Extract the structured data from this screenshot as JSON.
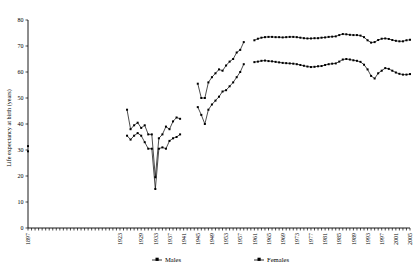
{
  "chart_data": {
    "type": "line",
    "title": "",
    "xlabel": "",
    "ylabel": "Life expectancy at birth (years)",
    "ylim": [
      0,
      80
    ],
    "ytick_step": 10,
    "yticks": [
      0,
      10,
      20,
      30,
      40,
      50,
      60,
      70,
      80
    ],
    "xlim": [
      1897,
      2005
    ],
    "xtick_labels": [
      "1897",
      "1923",
      "1929",
      "1933",
      "1937",
      "1941",
      "1945",
      "1949",
      "1953",
      "1957",
      "1961",
      "1965",
      "1969",
      "1973",
      "1977",
      "1981",
      "1985",
      "1989",
      "1993",
      "1997",
      "2001",
      "2005"
    ],
    "xtick_label_years": [
      1897,
      1923,
      1929,
      1933,
      1937,
      1941,
      1945,
      1949,
      1953,
      1957,
      1961,
      1965,
      1969,
      1973,
      1977,
      1981,
      1985,
      1989,
      1993,
      1997,
      2001,
      2005
    ],
    "grid": false,
    "legend_position": "bottom",
    "marker": "square",
    "series": [
      {
        "name": "Males",
        "marker": "square",
        "color": "#000000",
        "segments": [
          {
            "x": [
              1897
            ],
            "values": [
              29.5
            ]
          },
          {
            "x": [
              1925,
              1926,
              1927,
              1928,
              1929,
              1930,
              1931,
              1932,
              1933,
              1934,
              1935,
              1936,
              1937,
              1938,
              1939,
              1940
            ],
            "values": [
              35.5,
              34.0,
              35.5,
              36.5,
              35.5,
              33.0,
              30.5,
              30.5,
              15.0,
              30.5,
              31.0,
              30.5,
              33.5,
              34.5,
              35.0,
              36.0
            ]
          },
          {
            "x": [
              1945,
              1946,
              1947,
              1948,
              1949,
              1950,
              1951,
              1952,
              1953,
              1954,
              1955,
              1956,
              1957,
              1958
            ],
            "values": [
              46.5,
              43.5,
              40.0,
              45.5,
              47.5,
              49.0,
              50.5,
              52.5,
              53.0,
              54.5,
              56.0,
              58.0,
              60.0,
              63.0
            ]
          },
          {
            "x": [
              1961,
              1962,
              1963,
              1964,
              1965,
              1966,
              1967,
              1968,
              1969,
              1970,
              1971,
              1972,
              1973,
              1974,
              1975,
              1976,
              1977,
              1978,
              1979,
              1980,
              1981,
              1982,
              1983,
              1984,
              1985,
              1986,
              1987,
              1988,
              1989,
              1990,
              1991,
              1992,
              1993,
              1994,
              1995,
              1996,
              1997,
              1998,
              1999,
              2000,
              2001,
              2002,
              2003,
              2004,
              2005
            ],
            "values": [
              63.8,
              64.0,
              64.3,
              64.4,
              64.2,
              64.1,
              63.9,
              63.7,
              63.5,
              63.4,
              63.3,
              63.2,
              63.0,
              62.7,
              62.4,
              62.1,
              61.9,
              62.0,
              62.2,
              62.3,
              62.7,
              63.0,
              63.2,
              63.3,
              64.0,
              64.8,
              65.0,
              64.8,
              64.5,
              64.3,
              63.9,
              62.8,
              61.0,
              58.5,
              57.5,
              59.5,
              60.5,
              61.5,
              61.2,
              60.5,
              59.8,
              59.3,
              59.0,
              59.0,
              59.2
            ]
          }
        ]
      },
      {
        "name": "Females",
        "marker": "square",
        "color": "#000000",
        "segments": [
          {
            "x": [
              1897
            ],
            "values": [
              31.5
            ]
          },
          {
            "x": [
              1925,
              1926,
              1927,
              1928,
              1929,
              1930,
              1931,
              1932,
              1933,
              1934,
              1935,
              1936,
              1937,
              1938,
              1939,
              1940
            ],
            "values": [
              45.5,
              38.0,
              39.5,
              40.5,
              38.5,
              39.5,
              36.0,
              36.0,
              19.5,
              34.5,
              36.0,
              39.0,
              38.0,
              41.0,
              42.5,
              42.0
            ]
          },
          {
            "x": [
              1945,
              1946,
              1947,
              1948,
              1949,
              1950,
              1951,
              1952,
              1953,
              1954,
              1955,
              1956,
              1957,
              1958
            ],
            "values": [
              55.5,
              50.0,
              50.0,
              56.0,
              58.0,
              59.5,
              61.0,
              60.5,
              62.5,
              64.0,
              65.0,
              67.5,
              68.5,
              71.5
            ]
          },
          {
            "x": [
              1961,
              1962,
              1963,
              1964,
              1965,
              1966,
              1967,
              1968,
              1969,
              1970,
              1971,
              1972,
              1973,
              1974,
              1975,
              1976,
              1977,
              1978,
              1979,
              1980,
              1981,
              1982,
              1983,
              1984,
              1985,
              1986,
              1987,
              1988,
              1989,
              1990,
              1991,
              1992,
              1993,
              1994,
              1995,
              1996,
              1997,
              1998,
              1999,
              2000,
              2001,
              2002,
              2003,
              2004,
              2005
            ],
            "values": [
              72.2,
              72.8,
              73.2,
              73.4,
              73.5,
              73.5,
              73.4,
              73.4,
              73.3,
              73.4,
              73.5,
              73.5,
              73.4,
              73.2,
              73.0,
              72.9,
              72.9,
              73.0,
              73.0,
              73.2,
              73.3,
              73.5,
              73.6,
              73.7,
              74.2,
              74.6,
              74.5,
              74.3,
              74.2,
              74.2,
              74.0,
              73.4,
              72.2,
              71.3,
              71.5,
              72.3,
              72.8,
              72.9,
              72.7,
              72.3,
              72.0,
              71.8,
              71.8,
              72.2,
              72.4
            ]
          }
        ]
      }
    ],
    "legend": [
      {
        "label": "Males",
        "marker": "square"
      },
      {
        "label": "Females",
        "marker": "square"
      }
    ]
  }
}
